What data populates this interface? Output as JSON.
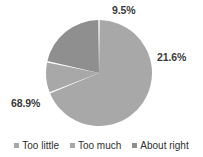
{
  "chart_data": {
    "type": "pie",
    "title": "",
    "categories": [
      "Too little",
      "Too much",
      "About right"
    ],
    "values": [
      68.9,
      9.5,
      21.6
    ],
    "data_labels": [
      "68.9%",
      "9.5%",
      "21.6%"
    ],
    "colors": [
      "#a8a8a8",
      "#a8a8a8",
      "#8f8f8f"
    ],
    "legend_position": "bottom",
    "grid": false,
    "start_angle_deg": 0,
    "direction": "clockwise",
    "slice_gap": true,
    "separator_color": "#ffffff"
  },
  "legend": {
    "items": [
      {
        "label": "Too little",
        "color": "#a8a8a8"
      },
      {
        "label": "Too much",
        "color": "#a8a8a8"
      },
      {
        "label": "About right",
        "color": "#8f8f8f"
      }
    ]
  },
  "labels": {
    "slice_0": "68.9%",
    "slice_1": "9.5%",
    "slice_2": "21.6%"
  }
}
